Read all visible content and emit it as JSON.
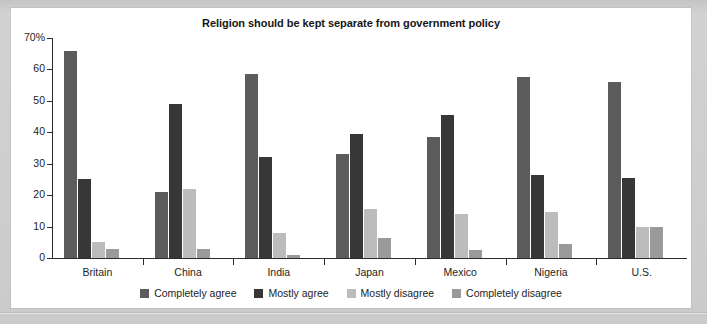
{
  "chart_data": {
    "type": "bar",
    "title": "Religion should be kept separate from government policy",
    "xlabel": "",
    "ylabel": "",
    "ylim": [
      0,
      70
    ],
    "yticks": [
      0,
      10,
      20,
      30,
      40,
      50,
      60,
      70
    ],
    "ytick_labels": [
      "0",
      "10",
      "20",
      "30",
      "40",
      "50",
      "60",
      "70%"
    ],
    "grid": false,
    "legend_position": "bottom",
    "categories": [
      "Britain",
      "China",
      "India",
      "Japan",
      "Mexico",
      "Nigeria",
      "U.S."
    ],
    "series": [
      {
        "name": "Completely agree",
        "color": "#5c5c5c",
        "values": [
          66,
          21,
          58.5,
          33,
          38.5,
          57.5,
          56
        ]
      },
      {
        "name": "Mostly agree",
        "color": "#373737",
        "values": [
          25,
          49,
          32,
          39.5,
          45.5,
          26.5,
          25.5
        ]
      },
      {
        "name": "Mostly disagree",
        "color": "#bcbcbc",
        "values": [
          5,
          22,
          8,
          15.5,
          14,
          14.5,
          10
        ]
      },
      {
        "name": "Completely disagree",
        "color": "#9a9a9a",
        "values": [
          3,
          3,
          1,
          6.5,
          2.5,
          4.5,
          10
        ]
      }
    ]
  },
  "figure": {
    "card_background": "#ffffff",
    "page_background": "#cfcfcf",
    "axis_color": "#2b2b2b",
    "text_color": "#1d1d1d"
  }
}
